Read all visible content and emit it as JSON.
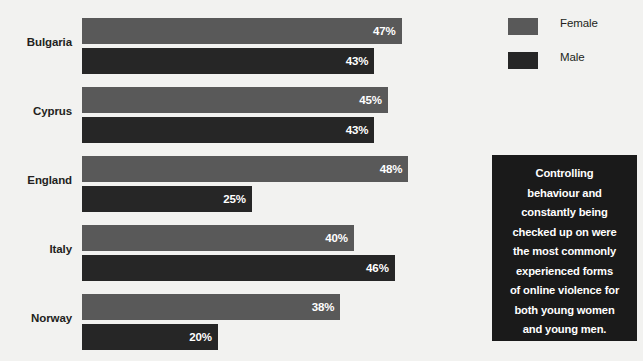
{
  "chart_data": {
    "type": "bar",
    "orientation": "horizontal",
    "title": "",
    "xlabel": "",
    "ylabel": "",
    "xlim": [
      0,
      50
    ],
    "grid": false,
    "legend_position": "top-right",
    "categories": [
      "Bulgaria",
      "Cyprus",
      "England",
      "Italy",
      "Norway"
    ],
    "series": [
      {
        "name": "Female",
        "color": "#595959",
        "values": [
          47,
          45,
          48,
          40,
          38
        ],
        "labels": [
          "47%",
          "45%",
          "48%",
          "40%",
          "38%"
        ]
      },
      {
        "name": "Male",
        "color": "#262626",
        "values": [
          43,
          43,
          25,
          46,
          20
        ],
        "labels": [
          "43%",
          "43%",
          "25%",
          "46%",
          "20%"
        ]
      }
    ],
    "annotations": [
      "Controlling behaviour and constantly being checked up on were the most commonly experienced forms of online violence for both young women and young men."
    ]
  },
  "legend": {
    "items": [
      {
        "label": "Female",
        "color": "#595959"
      },
      {
        "label": "Male",
        "color": "#262626"
      }
    ]
  },
  "callout": {
    "lines": [
      "Controlling",
      "behaviour and",
      "constantly being",
      "checked up on were",
      "the most commonly",
      "experienced forms",
      "of online violence for",
      "both young women",
      "and young men."
    ],
    "background": "#1a1a1a",
    "text_color": "#ffffff"
  },
  "colors": {
    "background": "#f2f2f0",
    "female": "#595959",
    "male": "#262626",
    "text": "#231f20",
    "value_text": "#ffffff"
  }
}
